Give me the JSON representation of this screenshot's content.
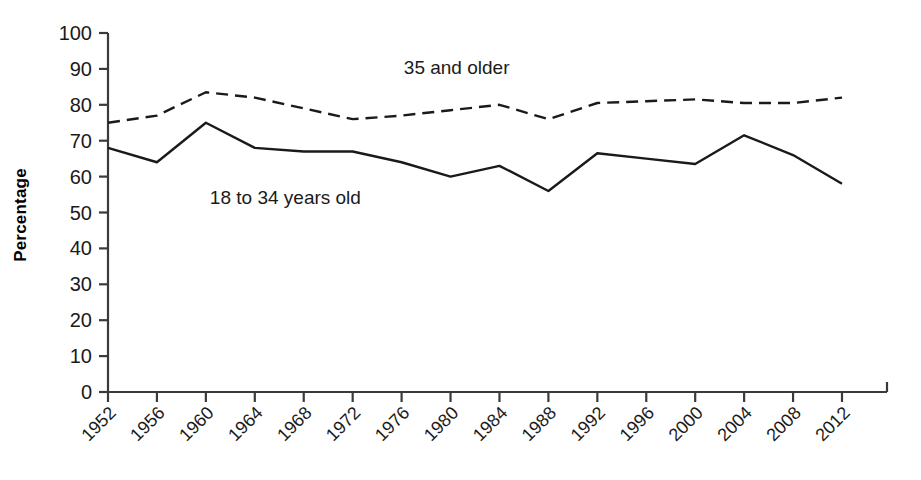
{
  "chart_data": {
    "type": "line",
    "title": "",
    "subtitle": "",
    "xlabel": "",
    "ylabel": "Percentage",
    "x": [
      1952,
      1956,
      1960,
      1964,
      1968,
      1972,
      1976,
      1980,
      1984,
      1988,
      1992,
      1996,
      2000,
      2004,
      2008,
      2012
    ],
    "categories": [
      "1952",
      "1956",
      "1960",
      "1964",
      "1968",
      "1972",
      "1976",
      "1980",
      "1984",
      "1988",
      "1992",
      "1996",
      "2000",
      "2004",
      "2008",
      "2012"
    ],
    "xlim": [
      1952,
      2012
    ],
    "ylim": [
      0,
      100
    ],
    "ytick_values": [
      0,
      10,
      20,
      30,
      40,
      50,
      60,
      70,
      80,
      90,
      100
    ],
    "ytick_labels": [
      "0",
      "10",
      "20",
      "30",
      "40",
      "50",
      "60",
      "70",
      "80",
      "90",
      "100"
    ],
    "grid": false,
    "legend_position": "inline-annotation",
    "xtick_rotation_deg": 45,
    "series": [
      {
        "name": "18 to 34 years old",
        "style": "solid",
        "color": "#1a1a1a",
        "values": [
          68,
          64,
          75,
          68,
          67,
          67,
          64,
          60,
          63,
          56,
          66.5,
          65,
          63.5,
          71.5,
          66,
          58
        ]
      },
      {
        "name": "35 and older",
        "style": "dashed",
        "color": "#1a1a1a",
        "values": [
          75,
          77,
          83.5,
          82,
          79,
          76,
          77,
          78.5,
          80,
          76,
          80.5,
          81,
          81.5,
          80.5,
          80.5,
          82
        ]
      }
    ],
    "annotations": [
      {
        "text": "35 and older",
        "x": 1980.5,
        "y": 88.5,
        "anchor": "middle"
      },
      {
        "text": "18 to 34 years old",
        "x": 1966.5,
        "y": 52.5,
        "anchor": "middle"
      }
    ]
  },
  "axes": {
    "y_axis_title": "Percentage",
    "y_min_label": "0",
    "y_max_label": "100"
  }
}
